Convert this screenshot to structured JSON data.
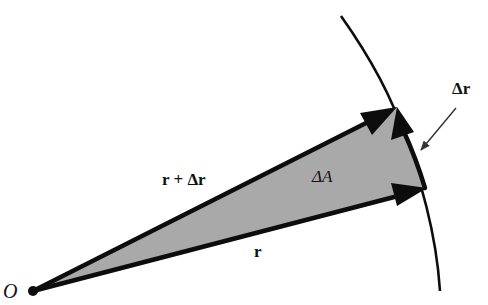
{
  "diagram": {
    "type": "vector-area-sweep",
    "colors": {
      "background": "#ffffff",
      "stroke": "#0d0d0d",
      "fill_sector": "#a9a9a9",
      "label": "#111111",
      "pointer": "#333333"
    },
    "labels": {
      "origin": "O",
      "r": "r",
      "r_plus_dr": "r + Δr",
      "delta_r": "Δr",
      "delta_A": "ΔA"
    }
  }
}
